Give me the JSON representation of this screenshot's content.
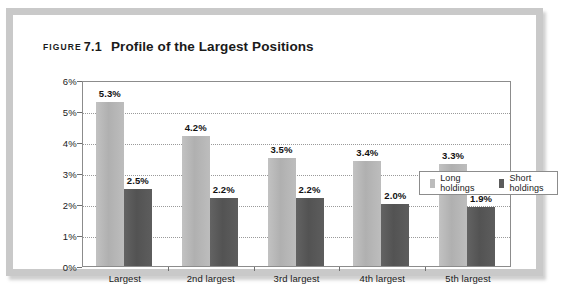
{
  "figure": {
    "label_word": "FIGURE",
    "number": "7.1",
    "title": "Profile of the Largest Positions"
  },
  "legend": {
    "position": "top-right-inside",
    "items": [
      {
        "label": "Long holdings",
        "color": "#bcbcbc"
      },
      {
        "label": "Short holdings",
        "color": "#5b5b5b"
      }
    ]
  },
  "axis": {
    "y_ticks": [
      "0%",
      "1%",
      "2%",
      "3%",
      "4%",
      "5%",
      "6%"
    ]
  },
  "chart_data": {
    "type": "bar",
    "title": "Profile of the Largest Positions",
    "xlabel": "",
    "ylabel": "",
    "ylim": [
      0,
      6
    ],
    "ytick_values": [
      0,
      1,
      2,
      3,
      4,
      5,
      6
    ],
    "ytick_labels": [
      "0%",
      "1%",
      "2%",
      "3%",
      "4%",
      "5%",
      "6%"
    ],
    "grid": true,
    "grid_axis": "y",
    "grid_style": "dotted",
    "legend_position": "upper right",
    "categories": [
      "Largest",
      "2nd largest",
      "3rd largest",
      "4th largest",
      "5th largest"
    ],
    "series": [
      {
        "name": "Long holdings",
        "color": "#bcbcbc",
        "values": [
          5.3,
          4.2,
          3.5,
          3.4,
          3.3
        ],
        "labels": [
          "5.3%",
          "4.2%",
          "3.5%",
          "3.4%",
          "3.3%"
        ]
      },
      {
        "name": "Short holdings",
        "color": "#5b5b5b",
        "values": [
          2.5,
          2.2,
          2.2,
          2.0,
          1.9
        ],
        "labels": [
          "2.5%",
          "2.2%",
          "2.2%",
          "2.0%",
          "1.9%"
        ]
      }
    ]
  }
}
